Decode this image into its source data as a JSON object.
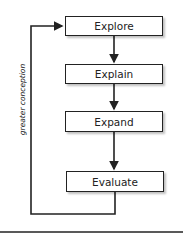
{
  "diagram": {
    "type": "flowchart",
    "stages": [
      {
        "label": "Explore"
      },
      {
        "label": "Explain"
      },
      {
        "label": "Expand"
      },
      {
        "label": "Evaluate"
      }
    ],
    "loop_label": "greater conception",
    "colors": {
      "line": "#222222",
      "box_fill": "#ffffff",
      "text": "#222222"
    }
  }
}
